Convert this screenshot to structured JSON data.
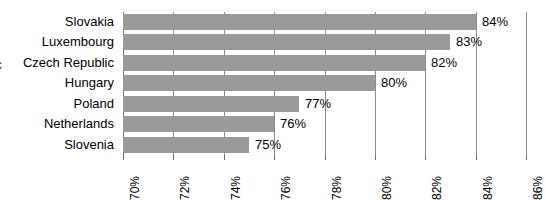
{
  "chart_data": {
    "type": "bar",
    "orientation": "horizontal",
    "title": "",
    "subtitle": "",
    "xlabel": "",
    "ylabel": "",
    "categories": [
      "Slovakia",
      "Luxembourg",
      "Czech Republic",
      "Hungary",
      "Poland",
      "Netherlands",
      "Slovenia"
    ],
    "values": [
      84,
      83,
      82,
      80,
      77,
      76,
      75
    ],
    "data_labels": [
      "84%",
      "83%",
      "82%",
      "80%",
      "77%",
      "76%",
      "75%"
    ],
    "xlim": [
      70,
      86
    ],
    "xticks": [
      70,
      72,
      74,
      76,
      78,
      80,
      82,
      84,
      86
    ],
    "xtick_labels": [
      "70%",
      "72%",
      "74%",
      "76%",
      "78%",
      "80%",
      "82%",
      "84%",
      "86%"
    ],
    "xtick_rotation": -90,
    "grid": true,
    "grid_axis": "x",
    "legend": false,
    "legend_position": "none",
    "bar_color": "#9a9a9a",
    "gridline_color": "#8c8c8c",
    "background_color": "#ffffff",
    "value_unit": "%"
  },
  "edge_artifact": {
    "text": "c"
  }
}
